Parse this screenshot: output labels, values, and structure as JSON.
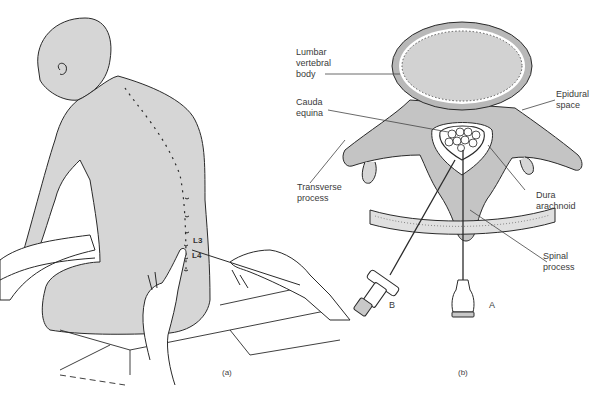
{
  "figure_a": {
    "caption": "(a)",
    "vertebra_labels": [
      "L3",
      "L4"
    ]
  },
  "figure_b": {
    "caption": "(b)",
    "labels": {
      "lumbar_vertebral_body": "Lumbar\nvertebral\nbody",
      "cauda_equina": "Cauda\nequina",
      "transverse_process": "Transverse\nprocess",
      "epidural_space": "Epidural\nspace",
      "dura_arachnoid": "Dura\narachnoid",
      "spinal_process": "Spinal\nprocess"
    },
    "needle_labels": {
      "a": "A",
      "b": "B"
    }
  },
  "colors": {
    "line": "#2a2a2a",
    "fill": "#d4d4d4",
    "fill_dark": "#bdbdbd",
    "background": "#ffffff"
  }
}
